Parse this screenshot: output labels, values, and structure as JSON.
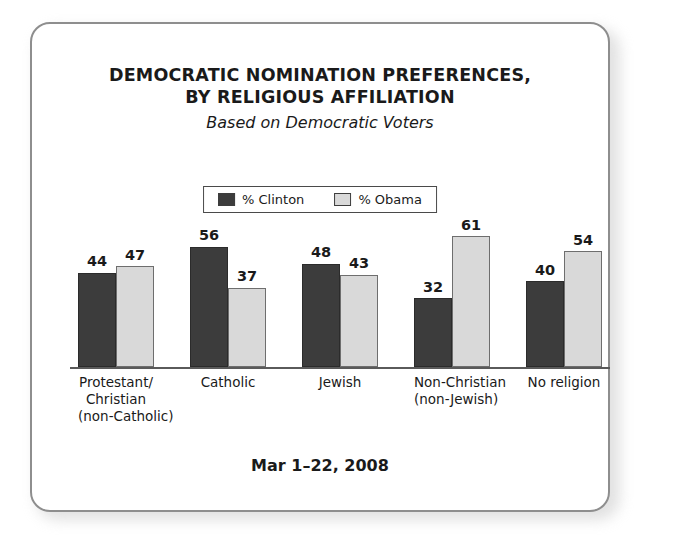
{
  "card": {
    "border_color": "#8e8e8e",
    "background": "#ffffff"
  },
  "title": {
    "line1": "DEMOCRATIC NOMINATION PREFERENCES,",
    "line2": "BY RELIGIOUS AFFILIATION",
    "subtitle": "Based on Democratic Voters"
  },
  "legend": {
    "items": [
      {
        "label": "% Clinton",
        "color": "#3c3c3c",
        "swatch_name": "legend-swatch-clinton"
      },
      {
        "label": "% Obama",
        "color": "#d9d9d9",
        "swatch_name": "legend-swatch-obama"
      }
    ]
  },
  "footer": {
    "date": "Mar 1–22, 2008"
  },
  "chart_data": {
    "type": "bar",
    "title": "DEMOCRATIC NOMINATION PREFERENCES, BY RELIGIOUS AFFILIATION",
    "subtitle": "Based on Democratic Voters",
    "note": "Mar 1–22, 2008",
    "xlabel": "",
    "ylabel": "",
    "ylim": [
      0,
      61
    ],
    "grid": false,
    "legend_position": "top-center",
    "value_labels": true,
    "categories": [
      [
        "Protestant/",
        "Christian",
        "(non-Catholic)"
      ],
      [
        "Catholic"
      ],
      [
        "Jewish"
      ],
      [
        "Non-Christian",
        "(non-Jewish)"
      ],
      [
        "No religion"
      ]
    ],
    "categories_flat": [
      "Protestant/Christian (non-Catholic)",
      "Catholic",
      "Jewish",
      "Non-Christian (non-Jewish)",
      "No religion"
    ],
    "series": [
      {
        "name": "% Clinton",
        "color": "#3c3c3c",
        "values": [
          44,
          56,
          48,
          32,
          40
        ]
      },
      {
        "name": "% Obama",
        "color": "#d9d9d9",
        "values": [
          47,
          37,
          43,
          61,
          54
        ]
      }
    ]
  }
}
